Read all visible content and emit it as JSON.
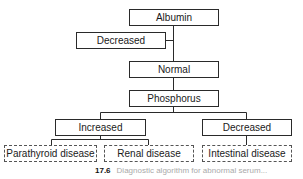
{
  "diagram": {
    "nodes": {
      "albumin": "Albumin",
      "albumin_decreased": "Decreased",
      "normal": "Normal",
      "phosphorus": "Phosphorus",
      "increased": "Increased",
      "phosphorus_decreased": "Decreased",
      "parathyroid": "Parathyroid disease",
      "renal": "Renal disease",
      "intestinal": "Intestinal disease"
    },
    "edges": [
      [
        "Albumin",
        "Decreased"
      ],
      [
        "Albumin",
        "Normal"
      ],
      [
        "Normal",
        "Phosphorus"
      ],
      [
        "Phosphorus",
        "Increased"
      ],
      [
        "Phosphorus",
        "Decreased"
      ],
      [
        "Increased",
        "Parathyroid disease"
      ],
      [
        "Increased",
        "Renal disease"
      ],
      [
        "Decreased",
        "Intestinal disease"
      ]
    ],
    "caption": {
      "number": "17.6",
      "text": "Diagnostic algorithm for abnormal serum..."
    }
  }
}
